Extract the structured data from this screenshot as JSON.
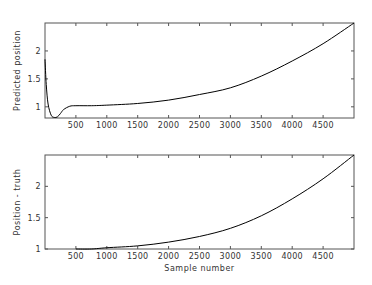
{
  "chart_data": [
    {
      "type": "line",
      "title": "",
      "xlabel": "",
      "ylabel": "Predicted position",
      "xlim": [
        0,
        5000
      ],
      "ylim": [
        0.8,
        2.5
      ],
      "grid": false,
      "x_ticks": [
        500,
        1000,
        1500,
        2000,
        2500,
        3000,
        3500,
        4000,
        4500
      ],
      "y_ticks": [
        1,
        1.5,
        2
      ],
      "x_tick_labels": [
        "500",
        "1000",
        "1500",
        "2000",
        "2500",
        "3000",
        "3500",
        "4000",
        "4500"
      ],
      "y_tick_labels": [
        "1",
        "1.5",
        "2"
      ],
      "series": [
        {
          "name": "Predicted position",
          "color": "#000000",
          "x": [
            0,
            20,
            50,
            100,
            150,
            200,
            250,
            300,
            400,
            500,
            750,
            1000,
            1500,
            2000,
            2500,
            3000,
            3500,
            4000,
            4500,
            5000
          ],
          "values": [
            1.85,
            1.4,
            1.05,
            0.85,
            0.81,
            0.82,
            0.88,
            0.95,
            1.01,
            1.02,
            1.02,
            1.03,
            1.06,
            1.12,
            1.22,
            1.34,
            1.55,
            1.82,
            2.13,
            2.5
          ]
        }
      ]
    },
    {
      "type": "line",
      "title": "",
      "xlabel": "Sample number",
      "ylabel": "Position - truth",
      "xlim": [
        0,
        5000
      ],
      "ylim": [
        1,
        2.5
      ],
      "grid": false,
      "x_ticks": [
        500,
        1000,
        1500,
        2000,
        2500,
        3000,
        3500,
        4000,
        4500
      ],
      "y_ticks": [
        1,
        1.5,
        2
      ],
      "x_tick_labels": [
        "500",
        "1000",
        "1500",
        "2000",
        "2500",
        "3000",
        "3500",
        "4000",
        "4500"
      ],
      "y_tick_labels": [
        "1",
        "1.5",
        "2"
      ],
      "series": [
        {
          "name": "Position - truth",
          "color": "#000000",
          "x": [
            500,
            750,
            1000,
            1500,
            2000,
            2500,
            3000,
            3500,
            4000,
            4500,
            5000
          ],
          "values": [
            1.0,
            1.0,
            1.02,
            1.05,
            1.11,
            1.2,
            1.33,
            1.53,
            1.8,
            2.12,
            2.5
          ]
        }
      ]
    }
  ]
}
